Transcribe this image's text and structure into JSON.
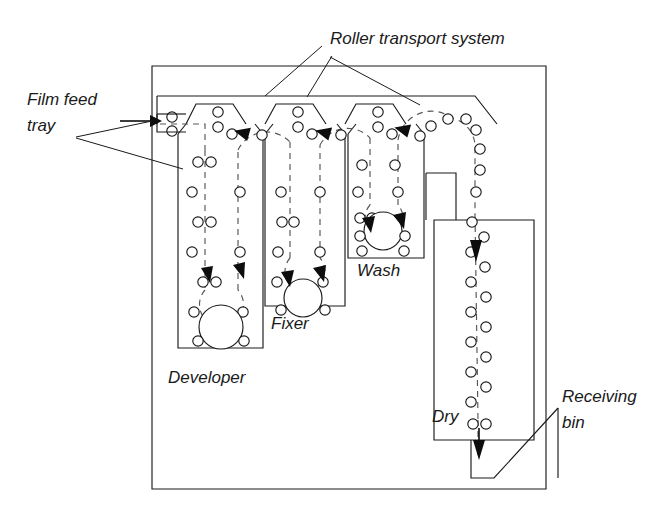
{
  "figure": {
    "type": "schematic-diagram",
    "background": "#ffffff",
    "line_color": "#1a1a1a"
  },
  "labels": {
    "roller_transport_system": "Roller transport system",
    "film_feed_tray_line1": "Film feed",
    "film_feed_tray_line2": "tray",
    "developer": "Developer",
    "fixer": "Fixer",
    "wash": "Wash",
    "dry": "Dry",
    "receiving_bin_line1": "Receiving",
    "receiving_bin_line2": "bin"
  },
  "components": [
    {
      "id": "cabinet",
      "name": "Outer cabinet",
      "kind": "enclosure"
    },
    {
      "id": "film-feed-tray",
      "name": "Film feed tray",
      "kind": "input"
    },
    {
      "id": "developer-tank",
      "name": "Developer",
      "kind": "processing-tank"
    },
    {
      "id": "fixer-tank",
      "name": "Fixer",
      "kind": "processing-tank"
    },
    {
      "id": "wash-tank",
      "name": "Wash",
      "kind": "processing-tank"
    },
    {
      "id": "dryer",
      "name": "Dry",
      "kind": "drying-chamber"
    },
    {
      "id": "receiving-bin",
      "name": "Receiving bin",
      "kind": "output"
    },
    {
      "id": "roller-system",
      "name": "Roller transport system",
      "kind": "transport"
    }
  ],
  "flow": {
    "direction": "left-to-right",
    "stages": [
      "Film feed tray",
      "Developer",
      "Fixer",
      "Wash",
      "Dry",
      "Receiving bin"
    ]
  }
}
